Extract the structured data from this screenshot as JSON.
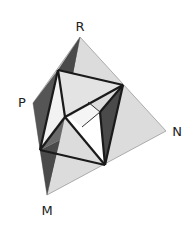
{
  "diagram": {
    "type": "tetrahedron-with-inscribed-octahedron",
    "vertices": {
      "R": {
        "label": "R",
        "x": 80,
        "y": 37,
        "label_x": 80,
        "label_y": 32
      },
      "P": {
        "label": "P",
        "x": 33,
        "y": 103,
        "label_x": 22,
        "label_y": 107
      },
      "N": {
        "label": "N",
        "x": 166,
        "y": 131,
        "label_x": 177,
        "label_y": 136
      },
      "M": {
        "label": "M",
        "x": 47,
        "y": 195,
        "label_x": 47,
        "label_y": 214
      }
    },
    "colors": {
      "light_face": "#d4d4d4",
      "lighter_face": "#e6e6e6",
      "dark_face": "#4a4a4a",
      "mid_face": "#8c8c8c",
      "edge": "#1a1a1a",
      "outline": "#9a9a9a"
    }
  }
}
